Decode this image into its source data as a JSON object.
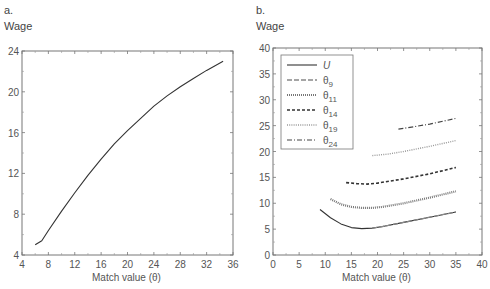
{
  "chart_data": [
    {
      "panel": "a.",
      "type": "line",
      "title": "",
      "ylabel": "Wage",
      "xlabel": "Match value (θ)",
      "xlim": [
        4,
        36
      ],
      "ylim": [
        4,
        24
      ],
      "xticks": [
        4,
        8,
        12,
        16,
        20,
        24,
        28,
        32,
        36
      ],
      "yticks": [
        4,
        8,
        12,
        16,
        20,
        24
      ],
      "grid": false,
      "series": [
        {
          "name": "Wage",
          "style": "solid",
          "x": [
            6,
            7,
            8,
            10,
            12,
            14,
            16,
            18,
            20,
            22,
            24,
            26,
            28,
            30,
            32,
            34.5
          ],
          "values": [
            5.0,
            5.4,
            6.4,
            8.3,
            10.1,
            11.8,
            13.4,
            14.9,
            16.2,
            17.4,
            18.6,
            19.6,
            20.5,
            21.3,
            22.1,
            23.0
          ]
        }
      ]
    },
    {
      "panel": "b.",
      "type": "line",
      "title": "",
      "ylabel": "Wage",
      "xlabel": "Match value (θ)",
      "xlim": [
        0,
        40
      ],
      "ylim": [
        0,
        40
      ],
      "xticks": [
        0,
        5,
        10,
        15,
        20,
        25,
        30,
        35,
        40
      ],
      "yticks": [
        0,
        5,
        10,
        15,
        20,
        25,
        30,
        35,
        40
      ],
      "grid": false,
      "legend_position": "upper left",
      "series": [
        {
          "name": "U",
          "style": "solid",
          "x": [
            9,
            11,
            13,
            15,
            17,
            19,
            21,
            25,
            30,
            35
          ],
          "values": [
            8.8,
            7.2,
            6.0,
            5.3,
            5.1,
            5.2,
            5.5,
            6.3,
            7.3,
            8.3
          ]
        },
        {
          "name": "θ9",
          "style": "dashed-long",
          "x": [
            19,
            21,
            25,
            30,
            35
          ],
          "values": [
            5.2,
            5.5,
            6.3,
            7.3,
            8.3
          ]
        },
        {
          "name": "θ11",
          "style": "dotted-dense",
          "x": [
            11,
            13,
            15,
            17,
            19,
            21,
            25,
            30,
            35
          ],
          "values": [
            10.8,
            9.8,
            9.3,
            9.1,
            9.1,
            9.3,
            10.0,
            11.1,
            12.3
          ]
        },
        {
          "name": "θ14",
          "style": "dashed-short",
          "x": [
            14,
            16,
            18,
            20,
            25,
            30,
            35
          ],
          "values": [
            14.0,
            13.8,
            13.7,
            13.9,
            14.7,
            15.7,
            16.9
          ]
        },
        {
          "name": "θ19",
          "style": "dotted-light",
          "x": [
            19,
            22,
            25,
            30,
            35
          ],
          "values": [
            19.2,
            19.5,
            20.0,
            21.0,
            22.1
          ]
        },
        {
          "name": "θ24",
          "style": "dash-dot",
          "x": [
            24,
            27,
            30,
            35
          ],
          "values": [
            24.3,
            24.8,
            25.3,
            26.4
          ]
        }
      ]
    }
  ],
  "panels": {
    "a": {
      "label": "a.",
      "ylabel": "Wage",
      "xlabel": "Match value (θ)",
      "xticks": [
        "4",
        "8",
        "12",
        "16",
        "20",
        "24",
        "28",
        "32",
        "36"
      ],
      "yticks": [
        "4",
        "8",
        "12",
        "16",
        "20",
        "24"
      ]
    },
    "b": {
      "label": "b.",
      "ylabel": "Wage",
      "xlabel": "Match value (θ)",
      "xticks": [
        "0",
        "5",
        "10",
        "15",
        "20",
        "25",
        "30",
        "35",
        "40"
      ],
      "yticks": [
        "0",
        "5",
        "10",
        "15",
        "20",
        "25",
        "30",
        "35",
        "40"
      ],
      "legend": {
        "items": [
          {
            "symbol": "U",
            "sub": ""
          },
          {
            "symbol": "θ",
            "sub": "9"
          },
          {
            "symbol": "θ",
            "sub": "11"
          },
          {
            "symbol": "θ",
            "sub": "14"
          },
          {
            "symbol": "θ",
            "sub": "19"
          },
          {
            "symbol": "θ",
            "sub": "24"
          }
        ]
      }
    }
  },
  "colors": {
    "line": "#3a3a3a",
    "axis": "#777777",
    "text": "#555555"
  }
}
